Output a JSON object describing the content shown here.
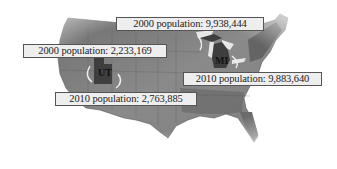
{
  "map": {
    "region": "United States",
    "highlighted_states": [
      {
        "abbr": "UT",
        "pop_2000_label": "2000 population: 2,233,169",
        "pop_2010_label": "2010 population: 2,763,885"
      },
      {
        "abbr": "MI",
        "pop_2000_label": "2000 population: 9,938,444",
        "pop_2010_label": "2010 population: 9,883,640"
      }
    ]
  },
  "colors": {
    "land": "#7a7a7a",
    "land_dark": "#5a5a5a",
    "highlight": "#3e3e3e",
    "label_bg": "#eeeeee",
    "label_border": "#555555"
  }
}
